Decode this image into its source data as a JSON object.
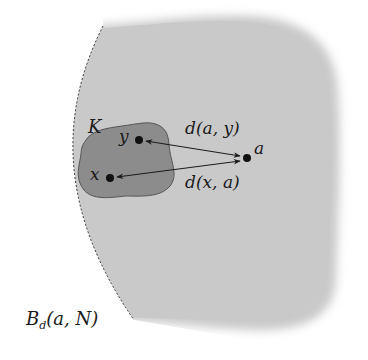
{
  "diagram": {
    "colors": {
      "ball_fill": "#c9c9c9",
      "set_fill": "#8c8c8c",
      "stroke": "#1a1a1a"
    },
    "ball": {
      "label": "B_d(a, N)",
      "label_parts": {
        "main": "B",
        "sub": "d",
        "args": "(a, N)"
      },
      "boundary_style": "dashed left arc, soft blurred right edge"
    },
    "set": {
      "label": "K"
    },
    "points": [
      {
        "id": "y",
        "label": "y",
        "x": 139,
        "y": 140
      },
      {
        "id": "x",
        "label": "x",
        "x": 110,
        "y": 178
      },
      {
        "id": "a",
        "label": "a",
        "x": 247,
        "y": 158
      }
    ],
    "arrows": [
      {
        "from": "a",
        "to": "y",
        "label": "d(a, y)",
        "double_headed": true
      },
      {
        "from": "x",
        "to": "a",
        "label": "d(x, a)",
        "double_headed": true
      }
    ]
  }
}
